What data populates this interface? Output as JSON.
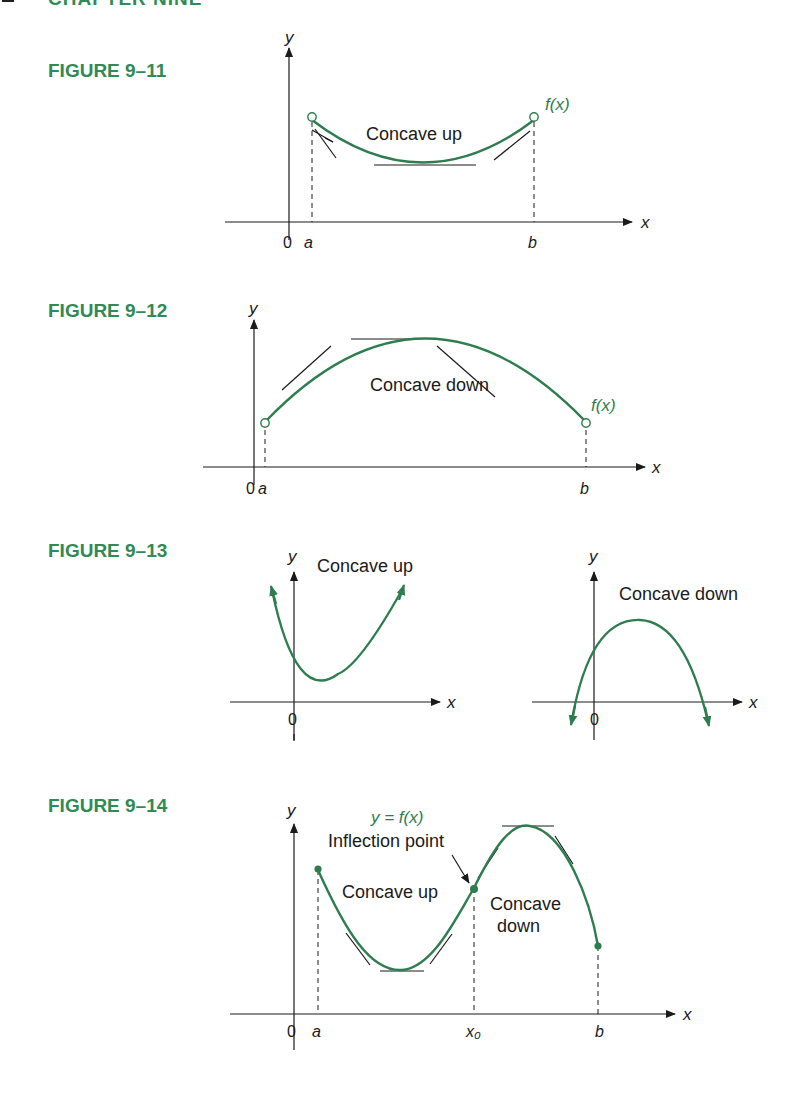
{
  "page": {
    "header": "CHAPTER NINE"
  },
  "figures": [
    {
      "label": "FIGURE 9–11",
      "axes": {
        "x": "x",
        "y": "y"
      },
      "annotations": {
        "curve_label": "f(x)",
        "region_label": "Concave up"
      },
      "ticks": [
        "0",
        "a",
        "b"
      ]
    },
    {
      "label": "FIGURE 9–12",
      "axes": {
        "x": "x",
        "y": "y"
      },
      "annotations": {
        "curve_label": "f(x)",
        "region_label": "Concave down"
      },
      "ticks": [
        "0",
        "a",
        "b"
      ]
    },
    {
      "label": "FIGURE 9–13",
      "panels": [
        {
          "axes": {
            "x": "x",
            "y": "y"
          },
          "region_label": "Concave up",
          "ticks": [
            "0"
          ]
        },
        {
          "axes": {
            "x": "x",
            "y": "y"
          },
          "region_label": "Concave down",
          "ticks": [
            "0"
          ]
        }
      ]
    },
    {
      "label": "FIGURE 9–14",
      "axes": {
        "x": "x",
        "y": "y"
      },
      "annotations": {
        "curve_label": "y = f(x)",
        "inflection_label": "Inflection point",
        "left_region": "Concave up",
        "right_region_line1": "Concave",
        "right_region_line2": "down"
      },
      "ticks": [
        "0",
        "a",
        "x₀",
        "b"
      ]
    }
  ],
  "colors": {
    "curve": "#2e7d4f",
    "label_green": "#2f8a55",
    "axis": "#1a1a1a"
  }
}
